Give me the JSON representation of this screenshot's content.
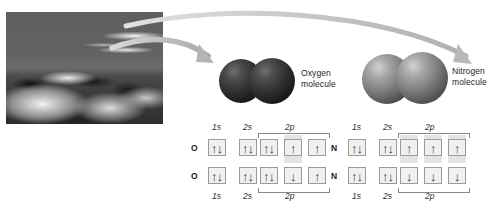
{
  "figure": {
    "photo": {
      "alt": "desert-sand-dunes-photograph"
    },
    "arrows": [
      {
        "name": "arrow-to-oxygen"
      },
      {
        "name": "arrow-to-nitrogen"
      }
    ],
    "molecules": [
      {
        "id": "oxygen",
        "label_line1": "Oxygen",
        "label_line2": "molecule",
        "color": "#2c2c2c"
      },
      {
        "id": "nitrogen",
        "label_line1": "Nitrogen",
        "label_line2": "molecule",
        "color": "#7d7d7d"
      }
    ],
    "diagrams": [
      {
        "id": "oxygen",
        "element": "O",
        "headers": {
          "s1": "1s",
          "s2": "2s",
          "p2": "2p"
        },
        "footers": {
          "s1": "1s",
          "s2": "2s",
          "p2": "2p"
        },
        "rows": [
          {
            "element": "O",
            "orbitals": {
              "1s": "up-down",
              "2s": "up-down",
              "2p": [
                "up-down",
                "up",
                "up"
              ]
            }
          },
          {
            "element": "O",
            "orbitals": {
              "1s": "up-down",
              "2s": "up-down",
              "2p": [
                "up-down",
                "down",
                "up"
              ]
            }
          }
        ]
      },
      {
        "id": "nitrogen",
        "element": "N",
        "headers": {
          "s1": "1s",
          "s2": "2s",
          "p2": "2p"
        },
        "footers": {
          "s1": "1s",
          "s2": "2s",
          "p2": "2p"
        },
        "rows": [
          {
            "element": "N",
            "orbitals": {
              "1s": "up-down",
              "2s": "up-down",
              "2p": [
                "up",
                "up",
                "up"
              ]
            }
          },
          {
            "element": "N",
            "orbitals": {
              "1s": "up-down",
              "2s": "up-down",
              "2p": [
                "down",
                "down",
                "down"
              ]
            }
          }
        ]
      }
    ],
    "glyphs": {
      "up": "↑",
      "down": "↓"
    },
    "colors": {
      "background": "#ffffff",
      "arrow": "#b9b9b9",
      "box_border": "#9a9a9a",
      "box_fill": "#f0f0f0",
      "text": "#1d1d1d"
    }
  }
}
